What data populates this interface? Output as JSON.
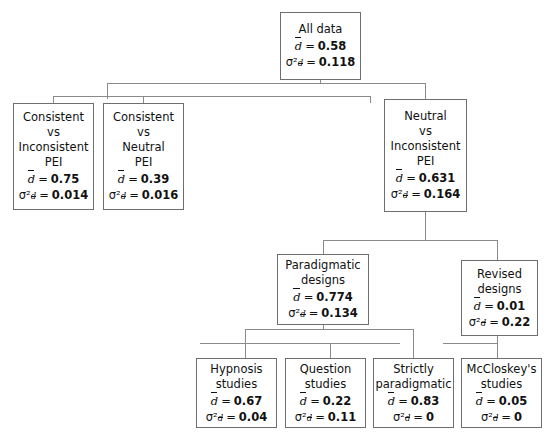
{
  "diagram": {
    "type": "meta-analysis-tree",
    "symbols": {
      "mean_symbol": "d",
      "variance_symbol": "σ²",
      "equals": "="
    },
    "nodes": [
      {
        "id": "all-data",
        "lines": [
          "All data"
        ],
        "mean": "0.58",
        "variance": "0.118"
      },
      {
        "id": "consistent-vs-inconsistent-pei",
        "lines": [
          "Consistent",
          "vs",
          "Inconsistent",
          "PEI"
        ],
        "mean": "0.75",
        "variance": "0.014"
      },
      {
        "id": "consistent-vs-neutral-pei",
        "lines": [
          "Consistent",
          "vs",
          "Neutral",
          "PEI"
        ],
        "mean": "0.39",
        "variance": "0.016"
      },
      {
        "id": "neutral-vs-inconsistent-pei",
        "lines": [
          "Neutral",
          "vs",
          "Inconsistent",
          "PEI"
        ],
        "mean": "0.631",
        "variance": "0.164"
      },
      {
        "id": "paradigmatic-designs",
        "lines": [
          "Paradigmatic",
          "designs"
        ],
        "mean": "0.774",
        "variance": "0.134"
      },
      {
        "id": "revised-designs",
        "lines": [
          "Revised",
          "designs"
        ],
        "mean": "0.01",
        "variance": "0.22"
      },
      {
        "id": "hypnosis-studies",
        "lines": [
          "Hypnosis",
          "studies"
        ],
        "mean": "0.67",
        "variance": "0.04"
      },
      {
        "id": "question-studies",
        "lines": [
          "Question",
          "studies"
        ],
        "mean": "0.22",
        "variance": "0.11"
      },
      {
        "id": "strictly-paradigmatic",
        "lines": [
          "Strictly",
          "paradigmatic"
        ],
        "mean": "0.83",
        "variance": "0"
      },
      {
        "id": "mccloskeys-studies",
        "lines": [
          "McCloskey's",
          "studies"
        ],
        "mean": "0.05",
        "variance": "0"
      }
    ]
  }
}
